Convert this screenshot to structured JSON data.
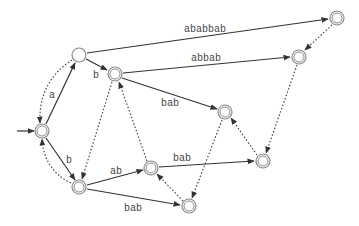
{
  "diagram": {
    "type": "automaton",
    "nodes": [
      {
        "id": "q0",
        "x": 42,
        "y": 131,
        "accepting": true,
        "initial": true
      },
      {
        "id": "q1",
        "x": 79,
        "y": 55,
        "accepting": false
      },
      {
        "id": "q2",
        "x": 115,
        "y": 74,
        "accepting": true
      },
      {
        "id": "q3",
        "x": 337,
        "y": 18,
        "accepting": true
      },
      {
        "id": "q4",
        "x": 299,
        "y": 57,
        "accepting": true
      },
      {
        "id": "q5",
        "x": 225,
        "y": 112,
        "accepting": true
      },
      {
        "id": "q6",
        "x": 79,
        "y": 187,
        "accepting": true
      },
      {
        "id": "q7",
        "x": 151,
        "y": 168,
        "accepting": true
      },
      {
        "id": "q8",
        "x": 263,
        "y": 161,
        "accepting": true
      },
      {
        "id": "q9",
        "x": 189,
        "y": 206,
        "accepting": true
      }
    ],
    "edges": [
      {
        "from": "q0",
        "to": "q1",
        "label": "a",
        "style": "solid"
      },
      {
        "from": "q0",
        "to": "q6",
        "label": "b",
        "style": "solid"
      },
      {
        "from": "q1",
        "to": "q2",
        "label": "b",
        "style": "solid"
      },
      {
        "from": "q1",
        "to": "q3",
        "label": "ababbab",
        "style": "solid"
      },
      {
        "from": "q2",
        "to": "q4",
        "label": "abbab",
        "style": "solid"
      },
      {
        "from": "q2",
        "to": "q5",
        "label": "bab",
        "style": "solid"
      },
      {
        "from": "q6",
        "to": "q7",
        "label": "ab",
        "style": "solid"
      },
      {
        "from": "q6",
        "to": "q9",
        "label": "bab",
        "style": "solid"
      },
      {
        "from": "q7",
        "to": "q8",
        "label": "bab",
        "style": "solid"
      },
      {
        "from": "q1",
        "to": "q0",
        "label": "",
        "style": "dotted"
      },
      {
        "from": "q6",
        "to": "q0",
        "label": "",
        "style": "dotted"
      },
      {
        "from": "q2",
        "to": "q6",
        "label": "",
        "style": "dotted"
      },
      {
        "from": "q7",
        "to": "q2",
        "label": "",
        "style": "dotted"
      },
      {
        "from": "q3",
        "to": "q4",
        "label": "",
        "style": "dotted"
      },
      {
        "from": "q4",
        "to": "q8",
        "label": "",
        "style": "dotted"
      },
      {
        "from": "q5",
        "to": "q9",
        "label": "",
        "style": "dotted"
      },
      {
        "from": "q8",
        "to": "q5",
        "label": "",
        "style": "dotted"
      },
      {
        "from": "q9",
        "to": "q7",
        "label": "",
        "style": "dotted"
      }
    ],
    "labels": {
      "q0_q1": "a",
      "q0_q6": "b",
      "q1_q2": "b",
      "q1_q3": "ababbab",
      "q2_q4": "abbab",
      "q2_q5": "bab",
      "q6_q7": "ab",
      "q6_q9": "bab",
      "q7_q8": "bab"
    }
  }
}
